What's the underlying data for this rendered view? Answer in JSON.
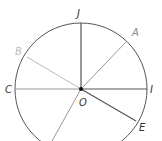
{
  "diagram": {
    "title": "",
    "center": {
      "label": "O",
      "x": 81,
      "y": 89
    },
    "radius": 66,
    "points": [
      {
        "label": "J",
        "color": "#333333"
      },
      {
        "label": "A",
        "color": "#888888"
      },
      {
        "label": "I",
        "color": "#333333"
      },
      {
        "label": "E",
        "color": "#333333"
      },
      {
        "label": "C",
        "color": "#333333"
      },
      {
        "label": "B",
        "color": "#bbbbbb"
      }
    ],
    "colors": {
      "circle": "#555555",
      "radius_dark": "#555555",
      "radius_mid": "#999999",
      "radius_light": "#bbbbbb",
      "center_dot": "#111111"
    }
  }
}
